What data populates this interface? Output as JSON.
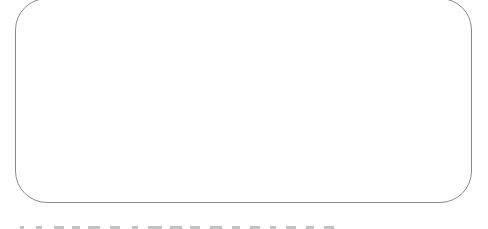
{
  "panel": {
    "border_color": "#8a8a8a",
    "background": "#ffffff",
    "content": ""
  },
  "footer_text": {
    "visible": true,
    "legible": false,
    "note": "Text line clipped at bottom edge; only glyph tops visible"
  }
}
